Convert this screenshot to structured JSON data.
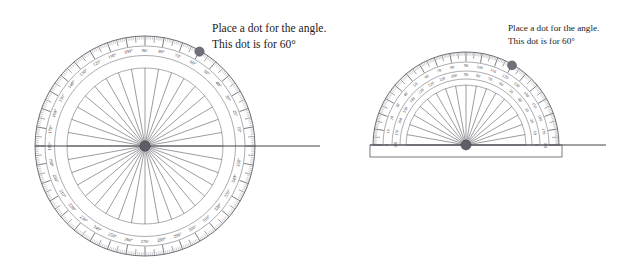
{
  "page": {
    "background": "#ffffff",
    "ink": "#3c3c44",
    "accent_dot_color": "#70707a"
  },
  "instructions": [
    {
      "id": "left",
      "line1": "Place a dot for the angle.",
      "line2": "This dot is for 60°"
    },
    {
      "id": "right",
      "line1": "Place a dot for the angle.",
      "line2": "This dot is for 60°"
    }
  ],
  "protractors": [
    {
      "id": "circular-protractor",
      "type": "full-circle",
      "span_degrees": 360,
      "center": {
        "x": 145,
        "y": 146
      },
      "radius_outer": 110,
      "radius_inner": 78,
      "tick_interval": 1,
      "label_interval": 10,
      "spoke_interval": 10,
      "degree_symbol": true,
      "labels": [
        "10°",
        "20°",
        "30°",
        "40°",
        "50°",
        "60°",
        "70°",
        "80°",
        "90°",
        "100°",
        "110°",
        "120°",
        "130°",
        "140°",
        "150°",
        "160°",
        "170°",
        "180°",
        "190°",
        "200°",
        "210°",
        "220°",
        "230°",
        "240°",
        "250°",
        "260°",
        "270°",
        "280°",
        "290°",
        "300°",
        "310°",
        "320°",
        "330°",
        "340°",
        "350°"
      ],
      "marked_dot_degrees": 60,
      "ray_degrees": 0,
      "ray_end_x": 320
    },
    {
      "id": "semicircular-protractor",
      "type": "half-circle",
      "span_degrees": 180,
      "center": {
        "x": 466,
        "y": 145
      },
      "radius_outer": 93,
      "radius_inner": 60,
      "tick_interval": 1,
      "label_interval": 10,
      "spoke_interval": 10,
      "degree_symbol": false,
      "outer_scale_labels": [
        "0",
        "10",
        "20",
        "30",
        "40",
        "50",
        "60",
        "70",
        "80",
        "90",
        "100",
        "110",
        "120",
        "130",
        "140",
        "150",
        "160",
        "170",
        "180"
      ],
      "inner_scale_labels": [
        "180",
        "170",
        "160",
        "150",
        "140",
        "130",
        "120",
        "110",
        "100",
        "90",
        "80",
        "70",
        "60",
        "50",
        "40",
        "30",
        "20",
        "10",
        "0"
      ],
      "marked_dot_degrees": 60,
      "ray_degrees": 0,
      "ray_end_x": 606,
      "base_rect": {
        "x": 370,
        "y": 145,
        "width": 192,
        "height": 12
      }
    }
  ]
}
